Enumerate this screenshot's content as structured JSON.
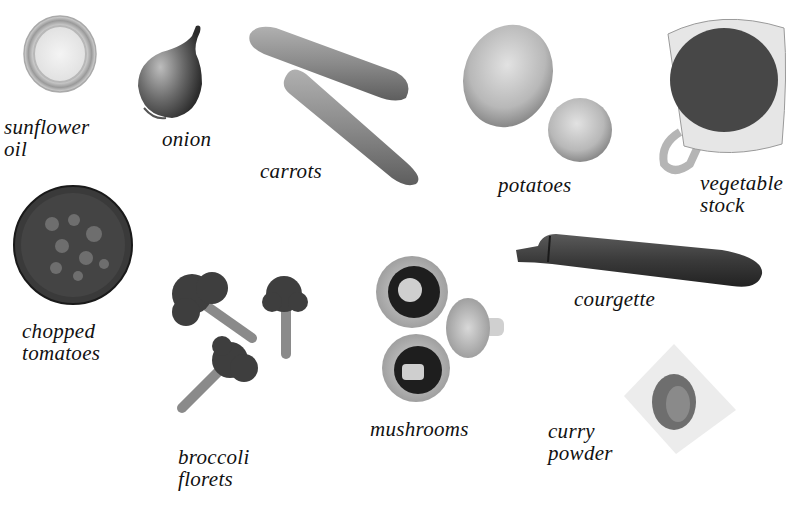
{
  "page": {
    "background": "#ffffff",
    "ingredients": [
      {
        "id": "sunflower-oil",
        "label_line1": "sunflower",
        "label_line2": "oil"
      },
      {
        "id": "onion",
        "label_line1": "onion"
      },
      {
        "id": "carrots",
        "label_line1": "carrots"
      },
      {
        "id": "potatoes",
        "label_line1": "potatoes"
      },
      {
        "id": "vegetable-stock",
        "label_line1": "vegetable",
        "label_line2": "stock"
      },
      {
        "id": "chopped-tomatoes",
        "label_line1": "chopped",
        "label_line2": "tomatoes"
      },
      {
        "id": "broccoli-florets",
        "label_line1": "broccoli",
        "label_line2": "florets"
      },
      {
        "id": "mushrooms",
        "label_line1": "mushrooms"
      },
      {
        "id": "courgette",
        "label_line1": "courgette"
      },
      {
        "id": "curry-powder",
        "label_line1": "curry",
        "label_line2": "powder"
      }
    ]
  }
}
